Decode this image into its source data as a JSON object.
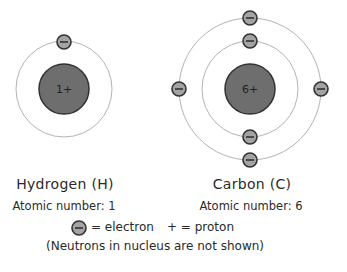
{
  "atoms": [
    {
      "name": "Hydrogen (H)",
      "atomic_number_label": "Atomic number: 1",
      "nucleus_label": "1+",
      "center": [
        64,
        89
      ],
      "nucleus_radius": 25,
      "orbits": [
        {
          "radius": 48,
          "electrons": 1
        }
      ]
    },
    {
      "name": "Carbon (C)",
      "atomic_number_label": "Atomic number: 6",
      "nucleus_label": "6+",
      "center": [
        250,
        89
      ],
      "nucleus_radius": 25,
      "orbits": [
        {
          "radius": 48,
          "electrons": 2
        },
        {
          "radius": 71,
          "electrons": 4
        }
      ]
    }
  ],
  "legend": {
    "electron_label": "= electron",
    "proton_label": "+ = proton",
    "note": "(Neutrons in nucleus are not shown)"
  },
  "colors": {
    "nucleus_fill": "#6e6e6e",
    "electron_fill": "#a3a3a3",
    "outline": "#333333",
    "orbit": "#b3b3b3",
    "text": "#2a2a2a"
  }
}
